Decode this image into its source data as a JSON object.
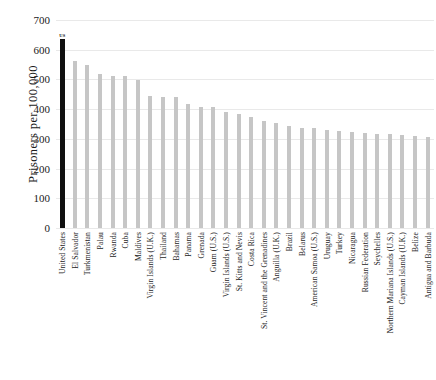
{
  "chart_data": {
    "type": "bar",
    "title": "",
    "xlabel": "",
    "ylabel": "Prisoners per 100,000",
    "ylim": [
      0,
      700
    ],
    "ytick_values": [
      0,
      100,
      200,
      300,
      400,
      500,
      600,
      700
    ],
    "ytick_labels": [
      "0",
      "100",
      "200",
      "300",
      "400",
      "500",
      "600",
      "700"
    ],
    "grid": true,
    "legend": false,
    "annotations": [
      {
        "text": "US",
        "category": "United States"
      }
    ],
    "bar_color": "#c6c6c6",
    "highlight_color": "#101010",
    "highlight_category": "United States",
    "categories": [
      "United States",
      "El Salvador",
      "Turkmenistan",
      "Palau",
      "Rwanda",
      "Cuba",
      "Maldives",
      "Virgin Islands (U.K.)",
      "Thailand",
      "Bahamas",
      "Panama",
      "Grenada",
      "Guam (U.S.)",
      "Virgin Islands (U.S.)",
      "St. Kitts and Nevis",
      "Costa Rica",
      "St. Vincent and the Grenadines",
      "Anguilla (U.K.)",
      "Brazil",
      "Belarus",
      "American Samoa (U.S.)",
      "Uruguay",
      "Turkey",
      "Nicaragua",
      "Russian Federation",
      "Seychelles",
      "Northern Mariana Islands (U.S.)",
      "Cayman Islands (U.K.)",
      "Belize",
      "Antigua and Barbuda"
    ],
    "values": [
      635,
      562,
      549,
      518,
      510,
      510,
      499,
      444,
      441,
      440,
      419,
      407,
      406,
      392,
      384,
      374,
      360,
      352,
      342,
      338,
      335,
      331,
      327,
      323,
      321,
      318,
      315,
      313,
      310,
      307
    ]
  }
}
